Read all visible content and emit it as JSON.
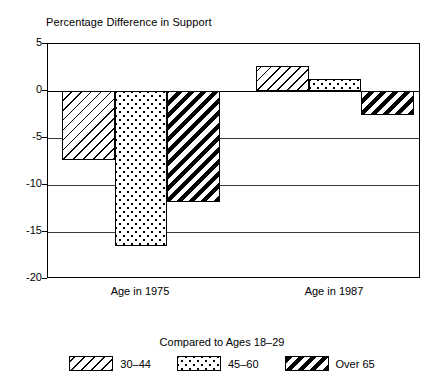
{
  "chart_data": {
    "type": "bar",
    "title": "Percentage Difference in Support",
    "xlabel": "",
    "ylabel": "",
    "ylim": [
      -20,
      5
    ],
    "yticks": [
      5,
      0,
      -5,
      -10,
      -15,
      -20
    ],
    "ytick_labels": [
      "5",
      "0",
      "-5",
      "-10",
      "-15",
      "-20"
    ],
    "grid": true,
    "legend_position": "bottom",
    "legend_title": "Compared to Ages 18–29",
    "categories": [
      "Age in 1975",
      "Age in 1987"
    ],
    "series": [
      {
        "name": "30–44",
        "pattern": "hatch-thin",
        "values": [
          -7.3,
          2.7
        ]
      },
      {
        "name": "45–60",
        "pattern": "dots",
        "values": [
          -16.5,
          1.3
        ]
      },
      {
        "name": "Over 65",
        "pattern": "hatch-bold",
        "values": [
          -11.8,
          -2.6
        ]
      }
    ]
  },
  "axis": {
    "ticks": [
      {
        "label": "5",
        "value": 5
      },
      {
        "label": "0",
        "value": 0
      },
      {
        "label": "-5",
        "value": -5
      },
      {
        "label": "-10",
        "value": -10
      },
      {
        "label": "-15",
        "value": -15
      },
      {
        "label": "-20",
        "value": -20
      }
    ]
  },
  "colors": {
    "ink": "#000000",
    "grid": "#3a3a3a",
    "background": "#ffffff"
  }
}
